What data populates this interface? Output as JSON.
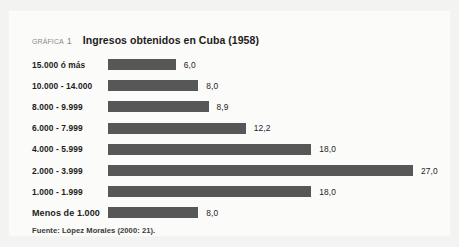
{
  "figure": {
    "kicker": "gráfica",
    "number": "1",
    "title": "Ingresos obtenidos en Cuba (1958)",
    "source": "Fuente: López Morales (2000: 21).",
    "bar_color": "#575757",
    "panel_color": "#fbfbfa",
    "page_background": "#f3f3f1",
    "text_color": "#1d1d1b",
    "kicker_color": "#8d8b86"
  },
  "chart_data": {
    "type": "bar",
    "orientation": "horizontal",
    "title": "Ingresos obtenidos en Cuba (1958)",
    "xlabel": "",
    "ylabel": "",
    "grid": false,
    "legend": false,
    "xlim": [
      0,
      27
    ],
    "categories": [
      "15.000 ó más",
      "10.000 - 14.000",
      "8.000 - 9.999",
      "6.000 - 7.999",
      "4.000 - 5.999",
      "2.000 - 3.999",
      "1.000 - 1.999",
      "Menos de 1.000"
    ],
    "values": [
      6.0,
      8.0,
      8.9,
      12.2,
      18.0,
      27.0,
      18.0,
      8.0
    ],
    "value_labels": [
      "6,0",
      "8,0",
      "8,9",
      "12,2",
      "18,0",
      "27,0",
      "18,0",
      "8,0"
    ],
    "source": "Fuente: López Morales (2000: 21)."
  }
}
